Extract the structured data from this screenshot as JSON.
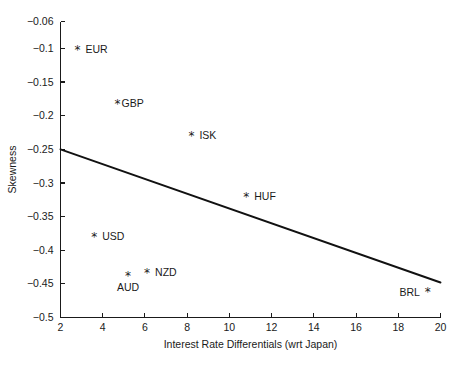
{
  "chart_data": {
    "type": "scatter",
    "title": "",
    "xlabel": "Interest Rate Differentials (wrt Japan)",
    "ylabel": "Skewness",
    "xlim": [
      2,
      20
    ],
    "ylim": [
      -0.5,
      -0.06
    ],
    "xticks": [
      2,
      4,
      6,
      8,
      10,
      12,
      14,
      16,
      18,
      20
    ],
    "xticklabels": [
      "2",
      "4",
      "6",
      "8",
      "10",
      "12",
      "14",
      "16",
      "18",
      "20"
    ],
    "yticks": [
      -0.06,
      -0.1,
      -0.15,
      -0.2,
      -0.25,
      -0.3,
      -0.35,
      -0.4,
      -0.45,
      -0.5
    ],
    "yticklabels": [
      "-0.06",
      "-0.1",
      "-0.15",
      "-0.2",
      "-0.25",
      "-0.3",
      "-0.35",
      "-0.4",
      "-0.45",
      "-0.5"
    ],
    "grid": false,
    "legend": false,
    "marker": "*",
    "marker_color": "#1a1a1a",
    "points": [
      {
        "label": "EUR",
        "x": 2.8,
        "y": -0.102,
        "label_pos": "right"
      },
      {
        "label": "GBP",
        "x": 4.7,
        "y": -0.182,
        "label_pos": "right-tight"
      },
      {
        "label": "ISK",
        "x": 8.2,
        "y": -0.23,
        "label_pos": "right"
      },
      {
        "label": "HUF",
        "x": 10.8,
        "y": -0.32,
        "label_pos": "right"
      },
      {
        "label": "USD",
        "x": 3.6,
        "y": -0.38,
        "label_pos": "right"
      },
      {
        "label": "AUD",
        "x": 5.2,
        "y": -0.438,
        "label_pos": "below"
      },
      {
        "label": "NZD",
        "x": 6.1,
        "y": -0.433,
        "label_pos": "right"
      },
      {
        "label": "BRL",
        "x": 19.4,
        "y": -0.462,
        "label_pos": "left"
      }
    ],
    "fit_line": {
      "name": "regression-line",
      "x_start": 2,
      "y_start": -0.25,
      "x_end": 20,
      "y_end": -0.448,
      "slope": -0.011,
      "intercept": -0.228,
      "color": "#111111"
    }
  }
}
